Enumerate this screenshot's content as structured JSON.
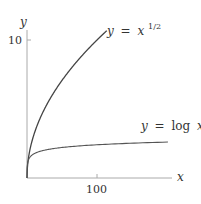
{
  "chart_data": {
    "type": "line",
    "title": "",
    "xlabel": "x",
    "ylabel": "y",
    "x_ticks": [
      {
        "value": 100,
        "label": "100"
      }
    ],
    "y_ticks": [
      {
        "value": 10,
        "label": "10"
      }
    ],
    "xlim": [
      0,
      208
    ],
    "ylim": [
      0,
      14.5
    ],
    "grid": false,
    "legend": "inline labels",
    "series": [
      {
        "name": "y = x^{1/2}",
        "label_lhs": "y",
        "label_eq": "=",
        "label_base": "x",
        "label_exp": "1/2",
        "function": "sqrt",
        "x": [
          0,
          1,
          5,
          10,
          20,
          40,
          60,
          80,
          100,
          115
        ],
        "values": [
          0,
          1,
          2.24,
          3.16,
          4.47,
          6.32,
          7.75,
          8.94,
          10,
          10.72
        ]
      },
      {
        "name": "y = log x",
        "label_lhs": "y",
        "label_eq": "=",
        "label_fn": "log",
        "label_arg": "x",
        "function": "log",
        "x": [
          1,
          2,
          5,
          10,
          20,
          50,
          100,
          150,
          200
        ],
        "values": [
          0,
          0.69,
          1.61,
          2.3,
          3.0,
          3.91,
          4.61,
          5.01,
          5.3
        ]
      }
    ]
  },
  "axes": {
    "x_label": "x",
    "y_label": "y",
    "x_tick_label": "100",
    "y_tick_label": "10"
  }
}
